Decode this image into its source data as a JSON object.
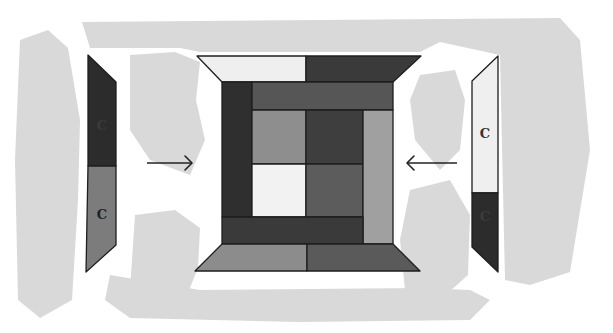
{
  "diagram": {
    "colors": {
      "background": "#ffffff",
      "wash": "#d9d9d9",
      "outline": "#1e1e1e",
      "ink": "#222222"
    },
    "washes": [
      {
        "name": "wash-top-band",
        "points": "82,22 560,18 580,40 590,150 570,272 530,285 505,280 500,55 440,42 420,52 200,52 180,48 90,48"
      },
      {
        "name": "wash-left-column",
        "points": "20,40 48,30 68,48 80,120 78,200 72,300 40,318 18,300 15,160"
      },
      {
        "name": "wash-left-blob",
        "points": "130,55 175,52 200,62 196,100 205,140 190,175 150,160 130,130"
      },
      {
        "name": "wash-bottom-left-blob",
        "points": "135,215 175,210 200,228 198,268 185,300 150,305 130,290"
      },
      {
        "name": "wash-bottom-band",
        "points": "110,275 200,290 420,288 470,290 490,300 470,320 300,322 130,318 105,300"
      },
      {
        "name": "wash-right-blob-top",
        "points": "420,75 455,70 465,100 460,150 440,170 415,140 410,100"
      },
      {
        "name": "wash-right-blob-bottom",
        "points": "410,190 450,180 470,215 468,275 440,300 405,290 400,240"
      }
    ],
    "center_block": {
      "label": "Center block",
      "pieces": [
        {
          "name": "top-trapezoid-left",
          "points": "197,56 306,56 306,82 222,82",
          "fill": "#efefef"
        },
        {
          "name": "top-trapezoid-right",
          "points": "306,56 421,56 393,82 306,82",
          "fill": "#3a3a3a"
        },
        {
          "name": "left-column",
          "points": "222,82 252,82 252,217 222,217",
          "fill": "#2f2f2f"
        },
        {
          "name": "top-strip",
          "points": "252,82 393,82 393,110 252,110",
          "fill": "#565656"
        },
        {
          "name": "inner-top-left",
          "points": "252,110 306,110 306,164 252,164",
          "fill": "#8e8e8e"
        },
        {
          "name": "inner-top-right",
          "points": "306,110 363,110 363,164 306,164",
          "fill": "#3e3e3e"
        },
        {
          "name": "inner-bottom-left",
          "points": "252,164 306,164 306,217 252,217",
          "fill": "#f2f2f2"
        },
        {
          "name": "inner-bottom-right",
          "points": "306,164 363,164 363,217 306,217",
          "fill": "#5c5c5c"
        },
        {
          "name": "right-column",
          "points": "363,110 393,110 393,244 363,244",
          "fill": "#a0a0a0"
        },
        {
          "name": "bottom-strip",
          "points": "222,217 363,217 363,244 222,244",
          "fill": "#3a3a3a"
        },
        {
          "name": "bottom-trapezoid-left",
          "points": "222,244 307,244 307,271 195,271",
          "fill": "#8c8c8c"
        },
        {
          "name": "bottom-trapezoid-right",
          "points": "307,244 393,244 420,271 307,271",
          "fill": "#5a5a5a"
        }
      ]
    },
    "left_strip": {
      "label": "Left C strip",
      "pieces": [
        {
          "name": "left-strip-top",
          "points": "88,55 116,82 116,166 88,166",
          "fill": "#2c2c2c",
          "text": "C",
          "tx": 102,
          "ty": 126,
          "tcolor": "#3a3a3a"
        },
        {
          "name": "left-strip-bottom",
          "points": "88,166 116,166 116,245 86,272",
          "fill": "#7c7c7c",
          "text": "C",
          "tx": 102,
          "ty": 215,
          "tcolor": "#222222"
        }
      ]
    },
    "right_strip": {
      "label": "Right C strip",
      "pieces": [
        {
          "name": "right-strip-top",
          "points": "472,81 498,56 498,193 472,193",
          "fill": "#efefef",
          "text": "C",
          "tx": 485,
          "ty": 134,
          "tcolor": "#333333"
        },
        {
          "name": "right-strip-bottom",
          "points": "472,193 498,193 498,272 472,247",
          "fill": "#2c2c2c",
          "text": "C",
          "tx": 485,
          "ty": 217,
          "tcolor": "#3c3c3c"
        }
      ]
    },
    "arrows": [
      {
        "name": "arrow-right",
        "direction": "right",
        "x1": 147,
        "y1": 163,
        "x2": 192,
        "y2": 163
      },
      {
        "name": "arrow-left",
        "direction": "left",
        "x1": 457,
        "y1": 163,
        "x2": 407,
        "y2": 163
      }
    ]
  }
}
